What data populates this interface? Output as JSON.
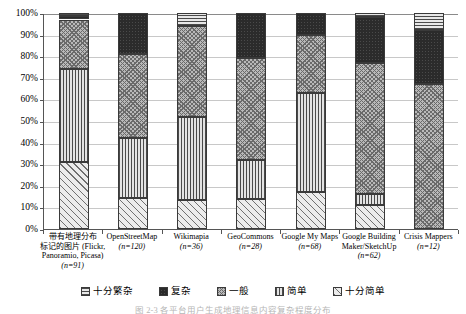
{
  "chart_data": {
    "type": "bar",
    "title": "",
    "xlabel": "",
    "ylabel": "",
    "ylim": [
      0,
      100
    ],
    "grid": true,
    "stacked": true,
    "stack_total": 100,
    "legend_position": "bottom",
    "ytick_labels": [
      "100%",
      "90%",
      "80%",
      "70%",
      "60%",
      "50%",
      "40%",
      "30%",
      "20%",
      "10%",
      "0%"
    ],
    "ytick_values": [
      100,
      90,
      80,
      70,
      60,
      50,
      40,
      30,
      20,
      10,
      0
    ],
    "categories": [
      "带有地理分布标记的图片 (Flickr, Panoramio, Picasa)",
      "OpenStreetMap",
      "Wikimapia",
      "GeoCommons",
      "Google My Maps",
      "Google Building Maker/SketchUp",
      "Crisis Mappers"
    ],
    "category_lines": [
      [
        "带有地理分布",
        "标记的图片 (Flickr,",
        "Panoramio, Picasa)",
        "(n=91)"
      ],
      [
        "OpenStreetMap",
        "(n=120)"
      ],
      [
        "Wikimapia",
        "(n=36)"
      ],
      [
        "GeoCommons",
        "(n=28)"
      ],
      [
        "Google My Maps",
        "(n=68)"
      ],
      [
        "Google Building",
        "Maker/SketchUp",
        "(n=62)"
      ],
      [
        "Crisis Mappers",
        "(n=12)"
      ]
    ],
    "sample_sizes": [
      "n=91",
      "n=120",
      "n=36",
      "n=28",
      "n=68",
      "n=62",
      "n=12"
    ],
    "series": [
      {
        "name": "十分简单",
        "pattern": "p-vsimple",
        "values": [
          31,
          14.5,
          13.5,
          14,
          17,
          11,
          0
        ]
      },
      {
        "name": "简单",
        "pattern": "p-simple",
        "values": [
          43,
          27.5,
          38.5,
          18,
          46,
          5,
          0
        ]
      },
      {
        "name": "一般",
        "pattern": "p-average",
        "values": [
          23,
          39,
          42,
          47,
          27,
          61,
          67
        ]
      },
      {
        "name": "复杂",
        "pattern": "p-complex",
        "values": [
          1.5,
          19,
          0,
          21,
          10,
          21,
          25
        ]
      },
      {
        "name": "十分繁杂",
        "pattern": "p-vcomplex",
        "values": [
          1.5,
          0,
          6,
          0,
          0,
          2,
          8
        ]
      }
    ],
    "legend_entries": [
      {
        "label": "十分繁杂",
        "pattern": "p-vcomplex"
      },
      {
        "label": "复杂",
        "pattern": "p-complex"
      },
      {
        "label": "一般",
        "pattern": "p-average"
      },
      {
        "label": "简单",
        "pattern": "p-simple"
      },
      {
        "label": "十分简单",
        "pattern": "p-vsimple"
      }
    ],
    "colors": {
      "axis": "#555555",
      "gridline": "#c8c8c8",
      "bar_outline": "#3a3a3a",
      "background": "#ffffff"
    }
  },
  "caption": {
    "text": "图 2-3  各平台用户生成地理信息内容复杂程度分布"
  }
}
